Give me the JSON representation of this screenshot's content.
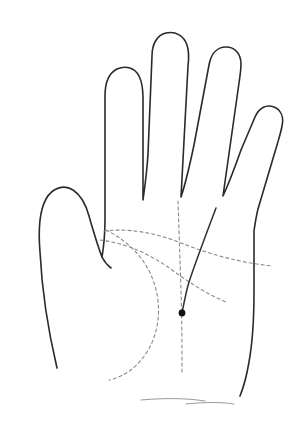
{
  "figure": {
    "title": "Palm line diagram",
    "width": 293,
    "height": 435,
    "background_color": "#ffffff"
  },
  "style": {
    "outline_color": "#2a2a2a",
    "outline_width": 1.6,
    "dashed_line_color": "#8a8a8a",
    "dashed_line_width": 1.1,
    "dash_pattern": "3,3",
    "solid_palm_line_color": "#2f2f2f",
    "solid_palm_line_width": 1.5,
    "wrist_crease_color": "#9a9a9a",
    "wrist_crease_width": 1.0,
    "marker_color": "#111111"
  },
  "hand": {
    "outline_label": "hand-outline",
    "outline_path": "M 57 368 C 48 330 42 292 40 252 C 38 228 40 210 46 199 C 52 188 64 184 73 190 C 81 195 86 205 89 216 C 93 230 97 244 102 257 L 102 257 C 104 245 105 232 105 219 L 105 96 C 105 82 109 73 117 69 C 126 65 135 68 139 76 C 142 82 143 90 143 98 L 143 200 L 143 200 C 145 186 147 170 148 154 L 152 56 C 152 44 157 35 166 33 C 176 31 184 36 187 45 C 189 51 189 58 188 66 L 181 197 L 181 197 C 186 182 190 164 194 145 L 209 65 C 211 54 217 47 226 47 C 235 47 241 54 241 64 C 241 70 240 76 239 83 L 223 196 L 223 196 C 229 183 235 167 241 150 L 255 117 C 259 108 266 104 274 107 C 281 110 284 117 282 126 C 281 132 279 138 277 145 L 258 209 C 256 217 255 224 254 231 L 254 292 C 254 316 253 340 249 362 C 247 374 244 386 240 396",
    "palm_edge_path": "M 240 396 C 243 386 246 374 248 362",
    "thumb_inner_path": "M 102 257 C 104 261 107 265 111 268",
    "fingers": [
      {
        "name": "index-finger",
        "tip_x": 123,
        "tip_y": 45
      },
      {
        "name": "middle-finger",
        "tip_x": 170,
        "tip_y": 26
      },
      {
        "name": "ring-finger",
        "tip_x": 226,
        "tip_y": 49
      },
      {
        "name": "little-finger",
        "tip_x": 269,
        "tip_y": 108
      },
      {
        "name": "thumb",
        "tip_x": 58,
        "tip_y": 190
      }
    ]
  },
  "palm_lines": [
    {
      "id": "heart-line",
      "label": "Heart line",
      "style": "dashed",
      "path": "M 104 231 C 130 228 156 233 181 243 C 207 253 235 262 272 266"
    },
    {
      "id": "head-line",
      "label": "Head line",
      "style": "dashed",
      "path": "M 100 240 C 126 243 150 254 172 270 C 190 283 207 294 226 302"
    },
    {
      "id": "life-line",
      "label": "Life line",
      "style": "dashed",
      "path": "M 106 230 C 128 241 145 258 153 280 C 162 304 160 331 147 352 C 137 368 123 377 109 380"
    },
    {
      "id": "fate-line",
      "label": "Fate line (vertical axis)",
      "style": "dashed",
      "path": "M 178 201 C 179 230 180 260 181 290 C 182 320 182 348 182 372"
    },
    {
      "id": "sun-line",
      "label": "Sun line",
      "style": "solid",
      "path": "M 216 208 C 207 232 197 258 189 282 C 186 292 184 303 182 313"
    }
  ],
  "wrist_creases": [
    {
      "id": "wrist-crease-1",
      "path": "M 141 400 C 163 398 186 398 205 401"
    },
    {
      "id": "wrist-crease-2",
      "path": "M 186 404 C 205 402 222 402 234 404"
    }
  ],
  "marker": {
    "id": "palm-point-marker",
    "label": "Marked palm point",
    "x": 182,
    "y": 313,
    "radius": 3.4,
    "shape": "dot"
  }
}
